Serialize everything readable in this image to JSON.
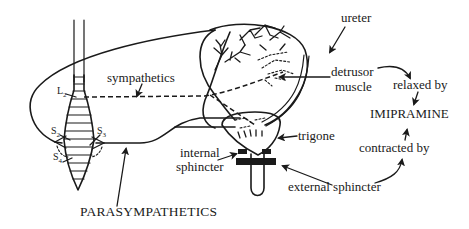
{
  "labels": {
    "ureter": "ureter",
    "sympathetics": "sympathetics",
    "l2": "L",
    "l2_sub": "2",
    "detrusor_line1": "detrusor",
    "detrusor_line2": "muscle",
    "relaxed_by": "relaxed by",
    "imipramine": "IMIPRAMINE",
    "contracted_by": "contracted by",
    "trigone": "trigone",
    "internal_line1": "internal",
    "internal_line2": "sphincter",
    "external_sphincter": "external sphincter",
    "parasympathetics": "PARASYMPATHETICS",
    "s2": "S",
    "s2_sub": "2",
    "s3": "S",
    "s3_sub": "3",
    "s4": "S",
    "s4_sub": "4"
  },
  "colors": {
    "ink": "#1a1a1a",
    "background": "#ffffff"
  }
}
